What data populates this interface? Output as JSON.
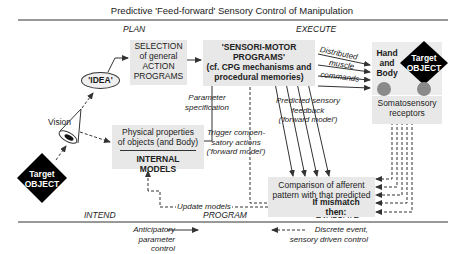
{
  "title": "Predictive 'Feed-forward' Sensory Control of Manipulation",
  "phases_top": {
    "plan": "PLAN",
    "execute": "EXECUTE"
  },
  "phases_bottom": {
    "intend": "INTEND",
    "program": "PROGRAM",
    "evaluate": "EVALUATE"
  },
  "nodes": {
    "idea": "'IDEA'",
    "vision": "Vision",
    "target_object_left": {
      "line1": "Target",
      "line2": "OBJECT"
    },
    "target_object_right": {
      "line1": "Target",
      "line2": "OBJECT"
    },
    "selection": {
      "line1": "SELECTION",
      "line2": "of general",
      "line3": "ACTION",
      "line4": "PROGRAMS"
    },
    "sensori_motor": {
      "line1": "'SENSORI-MOTOR",
      "line2": "PROGRAMS'",
      "line3": "(cf. CPG mechanisms and",
      "line4": "procedural memories)"
    },
    "hand_body": {
      "line1": "Hand",
      "line2": "and",
      "line3": "Body"
    },
    "somatosensory": {
      "line1": "Somatosensory",
      "line2": "receptors"
    },
    "physical_props": {
      "line1": "Physical properties",
      "line2": "of objects (and Body)"
    },
    "internal_models": "INTERNAL MODELS",
    "comparison": {
      "line1": "Comparison of afferent",
      "line2": "pattern with that predicted"
    },
    "mismatch": {
      "line1": "If mismatch",
      "line2": "then:"
    }
  },
  "edge_labels": {
    "distributed": "Distributed",
    "muscle": "muscle",
    "commands": "commands",
    "parameter_spec": {
      "line1": "Parameter",
      "line2": "specification"
    },
    "predicted_feedback": {
      "line1": "Predicted sensory",
      "line2": "feedback",
      "line3": "('forward model')"
    },
    "trigger": {
      "line1": "Trigger compen-",
      "line2": "satory actions",
      "line3": "('forward model')"
    },
    "update_models": "Update models"
  },
  "legend": {
    "anticipatory": {
      "line1": "Anticipatory",
      "line2": "parameter control"
    },
    "discrete": {
      "line1": "Discrete event,",
      "line2": "sensory driven control"
    }
  },
  "colors": {
    "box_fill": "#e8e8e8",
    "diamond_fill": "#000000",
    "receptor_fill": "#8a8a8a",
    "line": "#333333"
  }
}
